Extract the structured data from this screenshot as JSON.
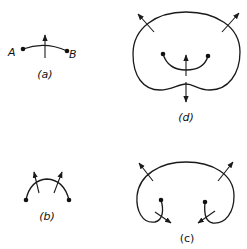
{
  "figure": {
    "panels": [
      {
        "id": "a",
        "caption": "(a)",
        "point_labels": [
          "A",
          "B"
        ],
        "description": "open arc between points A and B with a single normal arrow"
      },
      {
        "id": "b",
        "caption": "(b)",
        "description": "arc between two points with two outward normal arrows"
      },
      {
        "id": "c",
        "caption": "(c)",
        "description": "large curve with inward hooks ending at two points; outward arrows on top, arrows on hooks"
      },
      {
        "id": "d",
        "caption": "(d)",
        "description": "closed kidney-shaped curve with inner arc between two points; outward and normal arrows"
      }
    ]
  },
  "labels": {
    "a_caption": "(a)",
    "b_caption": "(b)",
    "c_caption": "(c)",
    "d_caption": "(d)",
    "point_a": "A",
    "point_b": "B"
  },
  "colors": {
    "ink": "#1a1a1a",
    "background": "#ffffff"
  }
}
